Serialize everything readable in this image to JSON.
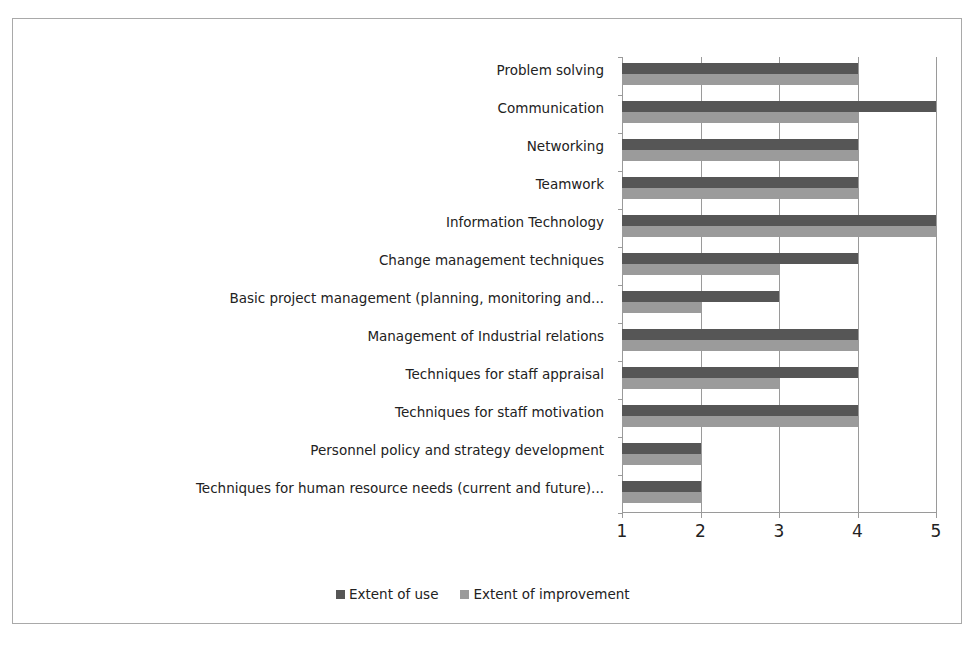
{
  "chart_data": {
    "type": "bar",
    "orientation": "horizontal",
    "title": "",
    "xlabel": "",
    "ylabel": "",
    "xlim": [
      1,
      5
    ],
    "x_ticks": [
      "1",
      "2",
      "3",
      "4",
      "5"
    ],
    "grid": true,
    "legend_position": "bottom",
    "categories": [
      "Problem solving",
      "Communication",
      "Networking",
      "Teamwork",
      "Information Technology",
      "Change management techniques",
      "Basic project management (planning, monitoring and...",
      "Management of Industrial relations",
      "Techniques for staff appraisal",
      "Techniques for staff motivation",
      "Personnel policy and strategy development",
      "Techniques for human resource needs (current and future)..."
    ],
    "series": [
      {
        "name": "Extent of use",
        "color": "#565656",
        "values": [
          4,
          5,
          4,
          4,
          5,
          4,
          3,
          4,
          4,
          4,
          2,
          2
        ]
      },
      {
        "name": "Extent of improvement",
        "color": "#9b9b9b",
        "values": [
          4,
          4,
          4,
          4,
          5,
          3,
          2,
          4,
          3,
          4,
          2,
          2
        ]
      }
    ]
  },
  "legend": {
    "items": [
      {
        "label": "Extent of use",
        "color": "#565656"
      },
      {
        "label": "Extent of improvement",
        "color": "#9b9b9b"
      }
    ]
  }
}
